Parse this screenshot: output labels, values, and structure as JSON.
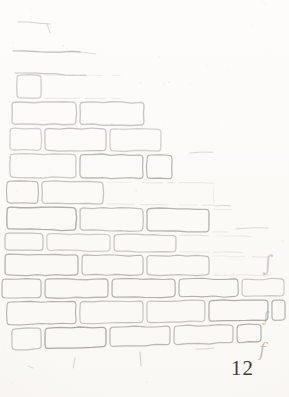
{
  "page": {
    "number": "12"
  },
  "palette": {
    "paper": "#fcfbf8",
    "pencil": "#8a8781",
    "pencil_faint": "#a8a49d",
    "page_number_color": "#3b3a38"
  },
  "sketch": {
    "label": "pencil sketch of a brick wall, broken away toward the upper right",
    "width": 289,
    "height": 397,
    "brick_inset": 2,
    "corner_radius": 3.5,
    "courses": [
      {
        "y": 73,
        "h": 27,
        "xl": 15,
        "xr": 122,
        "solid": 50,
        "t": [
          1,
          1
        ],
        "joints": [
          43,
          110
        ]
      },
      {
        "y": 100,
        "h": 26,
        "xl": 10,
        "xr": 146,
        "solid": 145,
        "t": [
          1,
          2
        ],
        "joints": [
          78
        ]
      },
      {
        "y": 126,
        "h": 26,
        "xl": 8,
        "xr": 163,
        "solid": 160,
        "t": [
          2,
          2
        ],
        "joints": [
          43,
          108
        ]
      },
      {
        "y": 152,
        "h": 27,
        "xl": 8,
        "xr": 174,
        "solid": 170,
        "t": [
          2,
          3
        ],
        "joints": [
          78,
          145
        ]
      },
      {
        "y": 179,
        "h": 26,
        "xl": 5,
        "xr": 216,
        "solid": 112,
        "t": [
          3,
          3
        ],
        "joints": [
          40,
          105,
          177
        ]
      },
      {
        "y": 205,
        "h": 26,
        "xl": 5,
        "xr": 233,
        "solid": 216,
        "t": [
          3,
          4
        ],
        "joints": [
          78,
          145,
          211
        ]
      },
      {
        "y": 231,
        "h": 21,
        "xl": 3,
        "xr": 253,
        "solid": 182,
        "t": [
          4,
          3
        ],
        "joints": [
          45,
          112,
          178
        ]
      },
      {
        "y": 252,
        "h": 25,
        "xl": 3,
        "xr": 271,
        "solid": 232,
        "t": [
          3,
          0
        ],
        "joints": [
          80,
          145,
          211
        ]
      },
      {
        "y": 277,
        "h": 23,
        "xl": 0,
        "xr": 286,
        "solid": 284,
        "t": [
          0,
          -2
        ],
        "joints": [
          43,
          110,
          177,
          240
        ]
      },
      {
        "y": 300,
        "h": 27,
        "xl": 5,
        "xr": 287,
        "solid": 285,
        "t": [
          -2,
          -5
        ],
        "joints": [
          78,
          145,
          207,
          270
        ]
      },
      {
        "y": 327,
        "h": 25,
        "xl": 10,
        "xr": 263,
        "solid": 258,
        "t": [
          -5,
          -9
        ],
        "joints": [
          43,
          108,
          172,
          235
        ]
      }
    ],
    "remnant_strokes": [
      {
        "x1": 18,
        "y1": 22,
        "x2": 50,
        "y2": 24,
        "o": 0.35,
        "w": 1
      },
      {
        "x1": 47,
        "y1": 24,
        "x2": 50,
        "y2": 33,
        "o": 0.3,
        "w": 1
      },
      {
        "x1": 13,
        "y1": 51,
        "x2": 80,
        "y2": 52,
        "o": 0.55,
        "w": 1.2
      },
      {
        "x1": 80,
        "y1": 52,
        "x2": 96,
        "y2": 54,
        "o": 0.25,
        "w": 1
      },
      {
        "x1": 15,
        "y1": 73,
        "x2": 86,
        "y2": 75,
        "o": 0.45,
        "w": 1.1
      },
      {
        "x1": 190,
        "y1": 153,
        "x2": 213,
        "y2": 152,
        "o": 0.3,
        "w": 1
      },
      {
        "x1": 215,
        "y1": 206,
        "x2": 231,
        "y2": 206,
        "o": 0.3,
        "w": 1
      },
      {
        "x1": 236,
        "y1": 229,
        "x2": 268,
        "y2": 228,
        "o": 0.3,
        "w": 1
      },
      {
        "x1": 75,
        "y1": 358,
        "x2": 73,
        "y2": 368,
        "o": 0.35,
        "w": 1
      },
      {
        "x1": 140,
        "y1": 352,
        "x2": 141,
        "y2": 366,
        "o": 0.4,
        "w": 1
      },
      {
        "x1": 196,
        "y1": 349,
        "x2": 214,
        "y2": 348,
        "o": 0.3,
        "w": 1
      },
      {
        "x1": 28,
        "y1": 366,
        "x2": 33,
        "y2": 368,
        "o": 0.25,
        "w": 1
      }
    ],
    "squiggles": [
      {
        "glyph": "∫",
        "x": 262,
        "y": 271,
        "size": 22,
        "o": 0.38
      },
      {
        "glyph": "∫",
        "x": 262,
        "y": 322,
        "size": 15,
        "o": 0.42
      },
      {
        "glyph": "f",
        "x": 259,
        "y": 356,
        "size": 18,
        "o": 0.5
      }
    ],
    "speck_count": 55
  }
}
